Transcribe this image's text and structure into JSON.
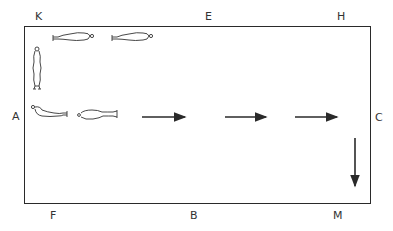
{
  "diagram": {
    "type": "dressage arena movement diagram",
    "markers": {
      "top": [
        "K",
        "E",
        "H"
      ],
      "left": "A",
      "right": "C",
      "bottom": [
        "F",
        "B",
        "M"
      ]
    },
    "figures": [
      {
        "pose": "standing",
        "position": "near A/K corner, vertical"
      },
      {
        "pose": "lying",
        "position": "top row near K",
        "count_in_row": 2
      },
      {
        "pose": "lying",
        "position": "middle row near A",
        "count_in_row": 2
      }
    ],
    "arrows": [
      {
        "direction": "right",
        "row": "center line"
      },
      {
        "direction": "right",
        "row": "center line"
      },
      {
        "direction": "right",
        "row": "center line"
      },
      {
        "direction": "down",
        "position": "near C/M"
      }
    ],
    "colors": {
      "line": "#2a2a2a",
      "background": "#ffffff"
    }
  }
}
